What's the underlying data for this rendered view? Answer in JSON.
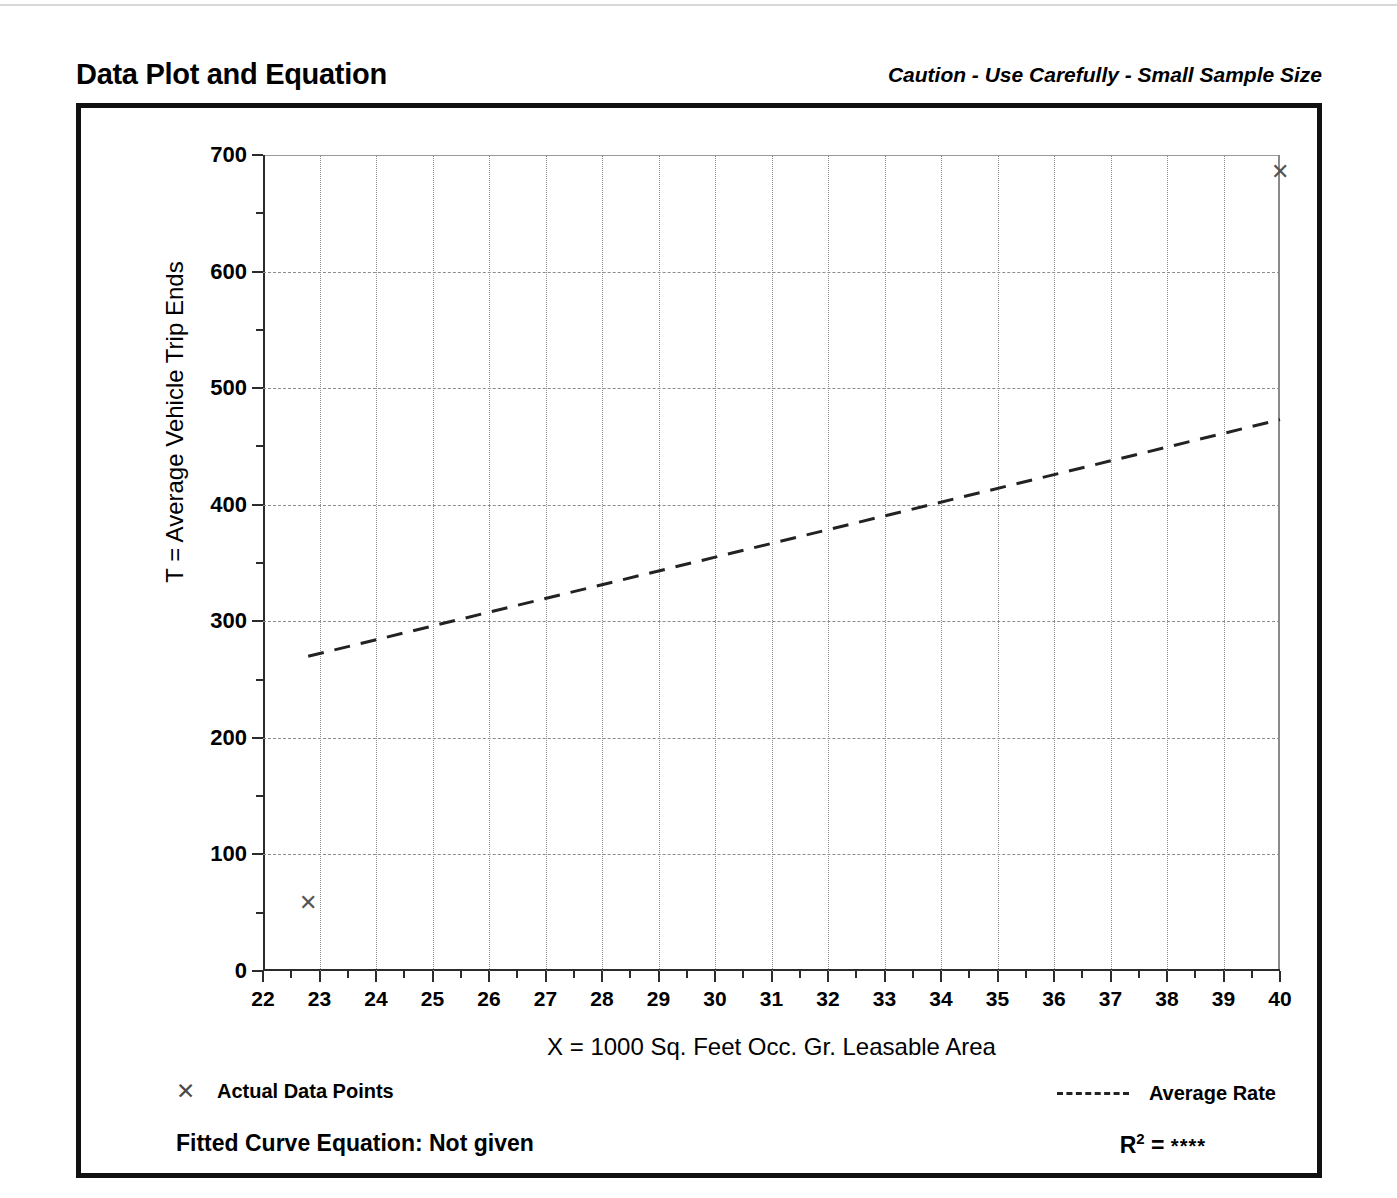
{
  "header": {
    "title": "Data Plot and Equation",
    "caution": "Caution - Use Carefully - Small Sample Size"
  },
  "legend": {
    "data_points_marker": "✕",
    "data_points_label": "Actual Data Points",
    "average_rate_label": "Average Rate"
  },
  "footer": {
    "fitted_curve_label": "Fitted Curve Equation:  Not given",
    "r2_label": "R",
    "r2_exponent": "2",
    "r2_equals": "=",
    "r2_value": "****"
  },
  "chart_data": {
    "type": "scatter",
    "title": "Data Plot and Equation",
    "xlabel": "X = 1000 Sq. Feet Occ. Gr. Leasable Area",
    "ylabel": "T = Average Vehicle Trip Ends",
    "xlim": [
      22,
      40
    ],
    "ylim": [
      0,
      700
    ],
    "xticks": [
      22,
      23,
      24,
      25,
      26,
      27,
      28,
      29,
      30,
      31,
      32,
      33,
      34,
      35,
      36,
      37,
      38,
      39,
      40
    ],
    "yticks": [
      0,
      100,
      200,
      300,
      400,
      500,
      600,
      700
    ],
    "x_minor_step": 0.5,
    "y_minor_step": 50,
    "grid": true,
    "legend_position": "below-plot",
    "series": [
      {
        "name": "Actual Data Points",
        "type": "scatter",
        "marker": "x",
        "points": [
          {
            "x": 22.8,
            "y": 58
          },
          {
            "x": 40.0,
            "y": 685
          }
        ]
      },
      {
        "name": "Average Rate",
        "type": "line",
        "style": "dashed",
        "points": [
          {
            "x": 22.8,
            "y": 270
          },
          {
            "x": 40.0,
            "y": 473
          }
        ]
      }
    ]
  }
}
